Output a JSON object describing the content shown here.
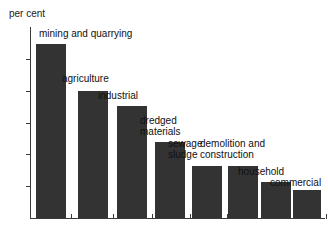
{
  "chart_data": {
    "type": "bar",
    "title": "",
    "subtitle": "",
    "xlabel": "",
    "ylabel": "per cent",
    "ylim": [
      0,
      30
    ],
    "ytick_labels": [
      "0",
      "5",
      "10",
      "15",
      "20",
      "25",
      "30"
    ],
    "ytick_values": [
      0,
      5,
      10,
      15,
      20,
      25,
      30
    ],
    "grid": false,
    "legend": null,
    "bar_color": "#333333",
    "axis_color": "#3a3a3a",
    "background_color": "#ffffff",
    "categories": [
      "mining and quarrying",
      "agriculture",
      "industrial",
      "dredged materials",
      "sewage sludge",
      "demolition and construction",
      "household",
      "commercial"
    ],
    "values": [
      27.3,
      20.0,
      17.6,
      11.9,
      8.2,
      8.2,
      5.6,
      4.4
    ]
  },
  "axis": {
    "y_title": "per cent"
  },
  "bars": [
    {
      "label_line1": "mining and quarrying",
      "label_line2": "",
      "value": 27.3
    },
    {
      "label_line1": "agriculture",
      "label_line2": "",
      "value": 20.0
    },
    {
      "label_line1": "industrial",
      "label_line2": "",
      "value": 17.6
    },
    {
      "label_line1": "dredged",
      "label_line2": "materials",
      "value": 11.9
    },
    {
      "label_line1": "sewage",
      "label_line2": "sludge",
      "value": 8.2
    },
    {
      "label_line1": "demolition and",
      "label_line2": "construction",
      "value": 8.2
    },
    {
      "label_line1": "household",
      "label_line2": "",
      "value": 5.6
    },
    {
      "label_line1": "commercial",
      "label_line2": "",
      "value": 4.4
    }
  ]
}
